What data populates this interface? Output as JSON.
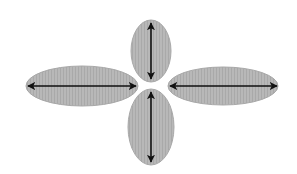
{
  "diagram": {
    "background": "#ffffff",
    "fill_color": "#b4b4b4",
    "stroke_color": "#a8a8a8",
    "arrow_color": "#111111",
    "lobes": [
      {
        "name": "top-lobe",
        "cx": 151,
        "cy": 51,
        "rx": 20,
        "ry": 31,
        "arrow": "vertical",
        "x1": 151,
        "y1": 23,
        "x2": 151,
        "y2": 79
      },
      {
        "name": "left-lobe",
        "cx": 82,
        "cy": 86,
        "rx": 56,
        "ry": 20,
        "arrow": "horizontal",
        "x1": 28,
        "y1": 86,
        "x2": 136,
        "y2": 86
      },
      {
        "name": "right-lobe",
        "cx": 223,
        "cy": 86,
        "rx": 55,
        "ry": 19,
        "arrow": "horizontal",
        "x1": 170,
        "y1": 86,
        "x2": 277,
        "y2": 86
      },
      {
        "name": "bottom-lobe",
        "cx": 151,
        "cy": 127,
        "rx": 23,
        "ry": 38,
        "arrow": "vertical",
        "x1": 151,
        "y1": 92,
        "x2": 151,
        "y2": 162
      }
    ]
  }
}
